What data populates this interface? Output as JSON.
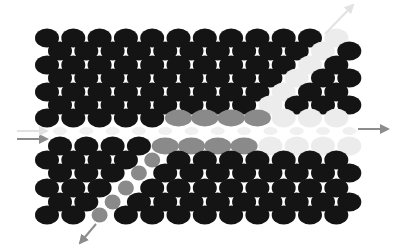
{
  "diagram": {
    "type": "photonic-crystal-waveguide-lattice",
    "lattice": {
      "origin_x_even": 47,
      "origin_x_odd": 60,
      "pitch_x": 26.3,
      "columns": 12,
      "hole_rx": 12,
      "hole_ry": 9.5
    },
    "colors": {
      "hole_dark": "#141414",
      "hole_grey": "#8a8a8a",
      "hole_ghost": "#ececec",
      "waveguide_ghost": "#f0f0f0",
      "arrow": "#8c8c8c",
      "arrow_faint": "#e2e2e2",
      "background": "#ffffff"
    },
    "rows": [
      {
        "y": 38,
        "parity": "even",
        "cells": "dddddddddddg"
      },
      {
        "y": 51,
        "parity": "odd",
        "cells": "ddddddddddgd"
      },
      {
        "y": 65,
        "parity": "even",
        "cells": "ddddddddddgd"
      },
      {
        "y": 78,
        "parity": "odd",
        "cells": "dddddddddgdd"
      },
      {
        "y": 92,
        "parity": "even",
        "cells": "dddddddddgdd"
      },
      {
        "y": 105,
        "parity": "odd",
        "cells": "ddddddddgddd"
      },
      {
        "y": 118,
        "parity": "even",
        "cells": "dddddEEEEggg"
      },
      {
        "y": 131,
        "parity": "odd",
        "cells": "wwwwwwwwwwww"
      },
      {
        "y": 146,
        "parity": "odd",
        "cells": "ddddEEEEgggg"
      },
      {
        "y": 160,
        "parity": "even",
        "cells": "ddddsddddddd"
      },
      {
        "y": 173,
        "parity": "odd",
        "cells": "dddsdddddddd"
      },
      {
        "y": 188,
        "parity": "even",
        "cells": "dddsdddddddd"
      },
      {
        "y": 202,
        "parity": "odd",
        "cells": "ddsddddddddd"
      },
      {
        "y": 215,
        "parity": "even",
        "cells": "ddsddddddddd"
      }
    ],
    "cell_legend": {
      "d": "dark hole",
      "g": "ghost (removed) hole",
      "E": "grey elongated hole (coupler region)",
      "s": "grey small hole (diagonal defect line)",
      "w": "faint waveguide marker"
    },
    "arrows": [
      {
        "name": "input-arrow",
        "x1": 17,
        "y1": 139,
        "x2": 47,
        "y2": 139,
        "style": "solid"
      },
      {
        "name": "input-arrow-faint",
        "x1": 17,
        "y1": 131,
        "x2": 47,
        "y2": 131,
        "style": "faint"
      },
      {
        "name": "through-output-arrow",
        "x1": 358,
        "y1": 129,
        "x2": 388,
        "y2": 129,
        "style": "solid"
      },
      {
        "name": "drop-upper-arrow",
        "x1": 325,
        "y1": 34,
        "x2": 353,
        "y2": 5,
        "style": "faint"
      },
      {
        "name": "drop-lower-arrow",
        "x1": 96,
        "y1": 224,
        "x2": 80,
        "y2": 243,
        "style": "solid"
      }
    ]
  }
}
